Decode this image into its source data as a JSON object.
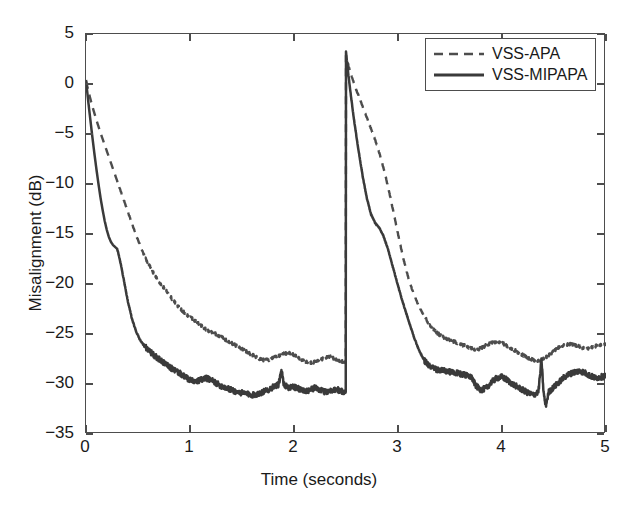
{
  "chart_data": {
    "type": "line",
    "title": "",
    "xlabel": "Time (seconds)",
    "ylabel": "Misalignment (dB)",
    "xlim": [
      0,
      5
    ],
    "ylim": [
      -35,
      5
    ],
    "xticks": [
      0,
      1,
      2,
      3,
      4,
      5
    ],
    "yticks": [
      5,
      0,
      -5,
      -10,
      -15,
      -20,
      -25,
      -30,
      -35
    ],
    "xtick_labels": [
      "0",
      "1",
      "2",
      "3",
      "4",
      "5"
    ],
    "ytick_labels": [
      "5",
      "0",
      "-5",
      "-10",
      "-15",
      "-20",
      "-25",
      "-30",
      "-35"
    ],
    "grid": false,
    "legend_position": "top-right",
    "annotations": [
      "Abrupt echo-path change at t = 2.5 s causes both curves to jump to about +3 dB",
      "Narrow upward spike on VSS-MIPAPA near t = 1.9 s",
      "Narrow downward spike on VSS-MIPAPA near t = 4.4 s"
    ],
    "series": [
      {
        "name": "VSS-APA",
        "style": "dashed",
        "color": "#4d4d4d",
        "x": [
          0.0,
          0.03,
          0.06,
          0.1,
          0.14,
          0.18,
          0.22,
          0.26,
          0.3,
          0.34,
          0.38,
          0.42,
          0.46,
          0.5,
          0.55,
          0.6,
          0.65,
          0.7,
          0.75,
          0.8,
          0.85,
          0.9,
          0.95,
          1.0,
          1.05,
          1.1,
          1.15,
          1.2,
          1.25,
          1.3,
          1.35,
          1.4,
          1.45,
          1.5,
          1.55,
          1.6,
          1.65,
          1.7,
          1.75,
          1.8,
          1.85,
          1.9,
          1.95,
          2.0,
          2.05,
          2.1,
          2.15,
          2.2,
          2.25,
          2.3,
          2.35,
          2.4,
          2.45,
          2.499,
          2.5,
          2.53,
          2.56,
          2.6,
          2.64,
          2.68,
          2.72,
          2.76,
          2.8,
          2.84,
          2.88,
          2.92,
          2.96,
          3.0,
          3.05,
          3.1,
          3.15,
          3.2,
          3.25,
          3.3,
          3.35,
          3.4,
          3.45,
          3.5,
          3.55,
          3.6,
          3.65,
          3.7,
          3.75,
          3.8,
          3.85,
          3.9,
          3.95,
          4.0,
          4.05,
          4.1,
          4.15,
          4.2,
          4.25,
          4.3,
          4.35,
          4.4,
          4.45,
          4.5,
          4.55,
          4.6,
          4.65,
          4.7,
          4.75,
          4.8,
          4.85,
          4.9,
          4.95,
          5.0
        ],
        "y": [
          0.3,
          -1.0,
          -2.2,
          -3.6,
          -4.9,
          -6.1,
          -7.3,
          -8.5,
          -9.7,
          -10.9,
          -12.1,
          -13.3,
          -14.5,
          -15.6,
          -16.9,
          -18.0,
          -18.9,
          -19.7,
          -20.4,
          -21.1,
          -21.8,
          -22.4,
          -22.9,
          -23.3,
          -23.7,
          -24.1,
          -24.5,
          -24.8,
          -25.0,
          -25.3,
          -25.6,
          -25.9,
          -26.2,
          -26.5,
          -26.8,
          -27.1,
          -27.4,
          -27.6,
          -27.6,
          -27.4,
          -27.2,
          -27.0,
          -26.9,
          -27.1,
          -27.4,
          -27.7,
          -27.9,
          -27.8,
          -27.6,
          -27.4,
          -27.3,
          -27.5,
          -27.7,
          -27.8,
          2.9,
          1.6,
          0.6,
          -0.6,
          -1.7,
          -2.8,
          -3.9,
          -5.0,
          -6.2,
          -7.6,
          -9.2,
          -11.0,
          -13.0,
          -15.0,
          -17.4,
          -19.4,
          -21.0,
          -22.2,
          -23.2,
          -24.0,
          -24.6,
          -25.1,
          -25.4,
          -25.6,
          -25.8,
          -26.0,
          -26.2,
          -26.4,
          -26.6,
          -26.4,
          -26.1,
          -25.9,
          -25.8,
          -25.9,
          -26.2,
          -26.5,
          -26.8,
          -27.1,
          -27.4,
          -27.6,
          -27.7,
          -27.5,
          -27.1,
          -26.7,
          -26.3,
          -26.1,
          -26.0,
          -26.1,
          -26.3,
          -26.5,
          -26.4,
          -26.2,
          -26.1,
          -26.0
        ]
      },
      {
        "name": "VSS-MIPAPA",
        "style": "solid",
        "color": "#3a3a3a",
        "x": [
          0.0,
          0.02,
          0.04,
          0.06,
          0.08,
          0.1,
          0.12,
          0.14,
          0.16,
          0.18,
          0.2,
          0.22,
          0.24,
          0.26,
          0.28,
          0.3,
          0.32,
          0.34,
          0.36,
          0.38,
          0.4,
          0.44,
          0.48,
          0.52,
          0.56,
          0.6,
          0.65,
          0.7,
          0.75,
          0.8,
          0.85,
          0.9,
          0.95,
          1.0,
          1.05,
          1.1,
          1.15,
          1.2,
          1.25,
          1.3,
          1.35,
          1.4,
          1.45,
          1.5,
          1.55,
          1.6,
          1.65,
          1.7,
          1.75,
          1.8,
          1.85,
          1.88,
          1.9,
          1.92,
          1.95,
          2.0,
          2.05,
          2.1,
          2.15,
          2.2,
          2.25,
          2.3,
          2.35,
          2.4,
          2.45,
          2.499,
          2.5,
          2.52,
          2.55,
          2.58,
          2.62,
          2.66,
          2.7,
          2.74,
          2.78,
          2.82,
          2.86,
          2.9,
          2.94,
          2.98,
          3.02,
          3.06,
          3.1,
          3.15,
          3.2,
          3.25,
          3.3,
          3.35,
          3.4,
          3.45,
          3.5,
          3.55,
          3.6,
          3.65,
          3.7,
          3.75,
          3.8,
          3.85,
          3.9,
          3.95,
          4.0,
          4.05,
          4.1,
          4.15,
          4.2,
          4.25,
          4.3,
          4.35,
          4.38,
          4.4,
          4.42,
          4.45,
          4.5,
          4.55,
          4.6,
          4.65,
          4.7,
          4.75,
          4.8,
          4.85,
          4.9,
          4.95,
          5.0
        ],
        "y": [
          0.4,
          -1.6,
          -3.4,
          -5.2,
          -6.9,
          -8.5,
          -10.0,
          -11.4,
          -12.6,
          -13.7,
          -14.6,
          -15.3,
          -15.8,
          -16.1,
          -16.3,
          -16.5,
          -17.3,
          -18.3,
          -19.4,
          -20.5,
          -21.6,
          -23.4,
          -24.7,
          -25.6,
          -26.2,
          -26.6,
          -27.1,
          -27.5,
          -27.9,
          -28.3,
          -28.6,
          -28.9,
          -29.3,
          -29.6,
          -29.8,
          -29.6,
          -29.4,
          -29.6,
          -29.9,
          -30.2,
          -30.4,
          -30.6,
          -30.8,
          -30.9,
          -31.0,
          -31.1,
          -31.0,
          -30.8,
          -30.6,
          -30.3,
          -30.1,
          -28.6,
          -30.0,
          -30.2,
          -30.4,
          -30.3,
          -30.5,
          -30.7,
          -30.6,
          -30.4,
          -30.6,
          -30.8,
          -30.7,
          -30.5,
          -30.7,
          -30.9,
          3.2,
          1.2,
          -1.4,
          -3.8,
          -6.6,
          -9.2,
          -11.4,
          -13.0,
          -13.9,
          -14.4,
          -15.2,
          -16.4,
          -17.9,
          -19.4,
          -20.9,
          -22.3,
          -23.6,
          -25.2,
          -26.6,
          -27.6,
          -28.2,
          -28.5,
          -28.6,
          -28.7,
          -28.8,
          -28.9,
          -29.0,
          -29.1,
          -29.2,
          -30.2,
          -30.6,
          -30.4,
          -29.8,
          -29.4,
          -29.3,
          -29.6,
          -30.0,
          -30.3,
          -30.6,
          -30.9,
          -31.1,
          -30.8,
          -27.6,
          -30.9,
          -32.2,
          -30.8,
          -30.3,
          -29.8,
          -29.3,
          -29.0,
          -28.8,
          -28.7,
          -28.9,
          -29.2,
          -29.4,
          -29.3,
          -29.2
        ]
      }
    ]
  },
  "legend": {
    "items": [
      {
        "label": "VSS-APA",
        "style": "dashed"
      },
      {
        "label": "VSS-MIPAPA",
        "style": "solid"
      }
    ]
  },
  "axes": {
    "x_title": "Time (seconds)",
    "y_title": "Misalignment (dB)"
  }
}
